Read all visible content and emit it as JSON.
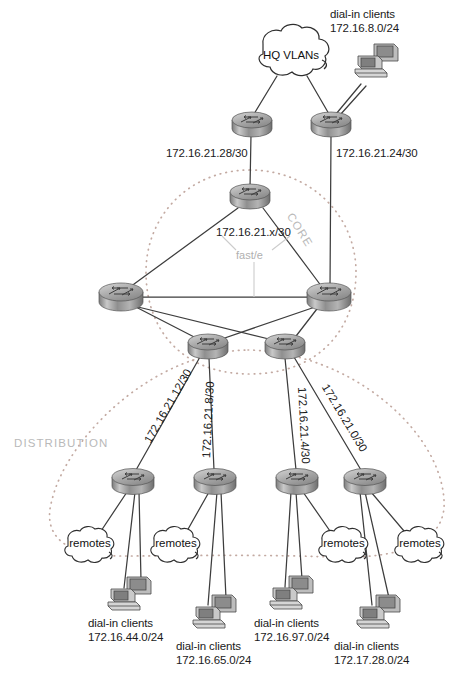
{
  "diagram": {
    "width": 461,
    "height": 684,
    "background": "#ffffff",
    "line_color": "#3a3a3a",
    "zone_color": "#b9b9b9",
    "dotted_color": "#c0a8a0"
  },
  "zones": [
    {
      "id": "core",
      "label": "CORE",
      "rotation": 58,
      "x": 292,
      "y": 206
    },
    {
      "id": "distribution",
      "label": "DISTRIBUTION",
      "x": 14,
      "y": 437
    }
  ],
  "clouds": {
    "hq": {
      "label": "HQ VLANs",
      "cx": 291,
      "cy": 56
    },
    "remotes": [
      {
        "label": "remotes",
        "cx": 90,
        "cy": 543
      },
      {
        "label": "remotes",
        "cx": 176,
        "cy": 543
      },
      {
        "label": "remotes",
        "cx": 344,
        "cy": 543
      },
      {
        "label": "remotes",
        "cx": 420,
        "cy": 543
      }
    ]
  },
  "routers": [
    {
      "id": "hq-left",
      "cx": 252,
      "cy": 124
    },
    {
      "id": "hq-right",
      "cx": 331,
      "cy": 124
    },
    {
      "id": "core-top",
      "cx": 250,
      "cy": 196
    },
    {
      "id": "core-left",
      "cx": 121,
      "cy": 296
    },
    {
      "id": "core-right",
      "cx": 329,
      "cy": 296
    },
    {
      "id": "dist-agg-left",
      "cx": 208,
      "cy": 346
    },
    {
      "id": "dist-agg-right",
      "cx": 285,
      "cy": 346
    },
    {
      "id": "dist-1",
      "cx": 133,
      "cy": 481
    },
    {
      "id": "dist-2",
      "cx": 215,
      "cy": 481
    },
    {
      "id": "dist-3",
      "cx": 297,
      "cy": 481
    },
    {
      "id": "dist-4",
      "cx": 365,
      "cy": 481
    }
  ],
  "hosts": [
    {
      "id": "host-hq",
      "cx": 377,
      "cy": 64
    },
    {
      "id": "host-44",
      "cx": 130,
      "cy": 597
    },
    {
      "id": "host-65",
      "cx": 215,
      "cy": 615
    },
    {
      "id": "host-97",
      "cx": 292,
      "cy": 596
    },
    {
      "id": "host-28",
      "cx": 379,
      "cy": 615
    }
  ],
  "labels": {
    "hq_clients_title": "dial-in clients",
    "hq_clients_subnet": "172.16.8.0/24",
    "link_hq_left": "172.16.21.28/30",
    "link_hq_right": "172.16.21.24/30",
    "core_subnet": "172.16.21.x/30",
    "fast_ethernet": "fast/e",
    "dist_link_1": "172.16.21.12/30",
    "dist_link_2": "172.16.21.8/30",
    "dist_link_3": "172.16.21.4/30",
    "dist_link_4": "172.16.21.0/30"
  },
  "client_groups": [
    {
      "id": "clients-44",
      "title": "dial-in clients",
      "subnet": "172.16.44.0/24",
      "x": 88,
      "y": 618
    },
    {
      "id": "clients-65",
      "title": "dial-in clients",
      "subnet": "172.16.65.0/24",
      "x": 176,
      "y": 641
    },
    {
      "id": "clients-97",
      "title": "dial-in clients",
      "subnet": "172.16.97.0/24",
      "x": 254,
      "y": 618
    },
    {
      "id": "clients-28",
      "title": "dial-in clients",
      "subnet": "172.17.28.0/24",
      "x": 334,
      "y": 641
    }
  ]
}
